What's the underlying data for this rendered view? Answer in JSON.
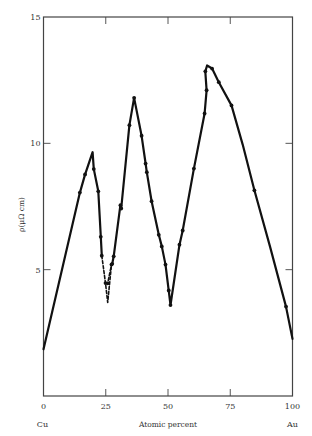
{
  "chart_data": {
    "type": "line",
    "title": "",
    "xlabel": "Atomic percent",
    "ylabel": "ρ(μΩ cm)",
    "x_end_labels": {
      "left": "Cu",
      "right": "Au"
    },
    "xlim": [
      0,
      100
    ],
    "ylim": [
      0,
      15
    ],
    "x_ticks": [
      0,
      25,
      50,
      75,
      100
    ],
    "y_ticks": [
      5,
      10,
      15
    ],
    "grid": false,
    "legend": null,
    "series": [
      {
        "name": "resistivity",
        "style": "solid",
        "points": [
          [
            0,
            1.85
          ],
          [
            14.6,
            8.05
          ],
          [
            16.7,
            8.77
          ],
          [
            19.7,
            9.65
          ],
          [
            20.2,
            8.98
          ],
          [
            22.0,
            8.1
          ],
          [
            23.0,
            6.3
          ],
          [
            23.4,
            5.55
          ]
        ]
      },
      {
        "name": "resistivity-ordered-dip",
        "style": "dashed",
        "points": [
          [
            23.4,
            5.55
          ],
          [
            24.9,
            4.47
          ],
          [
            25.8,
            3.7
          ],
          [
            27.3,
            5.2
          ],
          [
            27.6,
            5.23
          ]
        ]
      },
      {
        "name": "resistivity-alt-dip",
        "style": "dashed",
        "points": [
          [
            24.9,
            4.47
          ],
          [
            25.8,
            4.46
          ],
          [
            27.3,
            5.2
          ]
        ]
      },
      {
        "name": "resistivity-continued",
        "style": "solid",
        "points": [
          [
            27.6,
            5.23
          ],
          [
            28.2,
            5.53
          ],
          [
            30.9,
            7.55
          ],
          [
            31.2,
            7.42
          ],
          [
            34.5,
            10.72
          ],
          [
            36.4,
            11.8
          ],
          [
            39.4,
            10.3
          ],
          [
            41.0,
            9.2
          ],
          [
            41.5,
            8.86
          ],
          [
            43.4,
            7.71
          ],
          [
            46.3,
            6.38
          ],
          [
            47.5,
            5.92
          ],
          [
            49.0,
            5.2
          ],
          [
            50.3,
            4.18
          ],
          [
            51.0,
            3.6
          ],
          [
            54.6,
            5.99
          ],
          [
            55.9,
            6.55
          ],
          [
            60.4,
            9.0
          ],
          [
            64.7,
            11.18
          ],
          [
            65.5,
            12.1
          ],
          [
            65.0,
            12.85
          ],
          [
            65.7,
            13.08
          ],
          [
            67.7,
            12.96
          ],
          [
            70.4,
            12.42
          ],
          [
            75.5,
            11.5
          ],
          [
            80.0,
            9.95
          ],
          [
            84.7,
            8.14
          ],
          [
            91.0,
            5.9
          ],
          [
            97.4,
            3.54
          ],
          [
            100,
            2.26
          ]
        ]
      }
    ],
    "markers": [
      [
        14.6,
        8.05
      ],
      [
        16.7,
        8.77
      ],
      [
        20.2,
        8.98
      ],
      [
        22.0,
        8.1
      ],
      [
        23.0,
        6.3
      ],
      [
        23.4,
        5.55
      ],
      [
        24.9,
        4.47
      ],
      [
        25.8,
        4.46
      ],
      [
        27.3,
        5.2
      ],
      [
        27.6,
        5.23
      ],
      [
        28.2,
        5.53
      ],
      [
        30.9,
        7.55
      ],
      [
        31.2,
        7.42
      ],
      [
        34.5,
        10.72
      ],
      [
        36.4,
        11.8
      ],
      [
        39.4,
        10.3
      ],
      [
        41.0,
        9.2
      ],
      [
        41.5,
        8.86
      ],
      [
        43.4,
        7.71
      ],
      [
        46.3,
        6.38
      ],
      [
        47.5,
        5.92
      ],
      [
        49.0,
        5.2
      ],
      [
        50.3,
        4.18
      ],
      [
        51.0,
        3.6
      ],
      [
        54.6,
        5.99
      ],
      [
        55.9,
        6.55
      ],
      [
        60.4,
        9.0
      ],
      [
        64.7,
        11.18
      ],
      [
        65.5,
        12.1
      ],
      [
        65.0,
        12.85
      ],
      [
        67.7,
        12.96
      ],
      [
        70.4,
        12.42
      ],
      [
        75.5,
        11.5
      ],
      [
        84.7,
        8.14
      ],
      [
        97.4,
        3.54
      ]
    ]
  },
  "colors": {
    "line": "#111111",
    "axis": "#444444",
    "text": "#333333"
  }
}
